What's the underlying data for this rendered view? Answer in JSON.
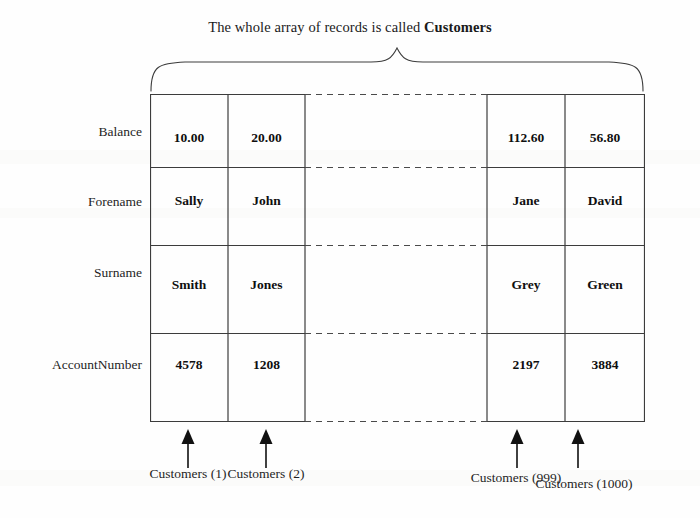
{
  "title": {
    "prefix": "The whole array of records is called ",
    "emphasis": "Customers"
  },
  "field_labels": [
    "Balance",
    "Forename",
    "Surname",
    "AccountNumber"
  ],
  "records": [
    {
      "caption": "Customers (1)",
      "Balance": "10.00",
      "Forename": "Sally",
      "Surname": "Smith",
      "AccountNumber": "4578"
    },
    {
      "caption": "Customers (2)",
      "Balance": "20.00",
      "Forename": "John",
      "Surname": "Jones",
      "AccountNumber": "1208"
    },
    {
      "caption": "Customers (999)",
      "Balance": "112.60",
      "Forename": "Jane",
      "Surname": "Grey",
      "AccountNumber": "2197"
    },
    {
      "caption": "Customers (1000)",
      "Balance": "56.80",
      "Forename": "David",
      "Surname": "Green",
      "AccountNumber": "3884"
    }
  ],
  "ellipsis_gap": {
    "present": true,
    "style": "dashed",
    "meaning": "records 3 through 998 omitted"
  },
  "colors": {
    "background": "#fefefe",
    "line": "#3c3c3c",
    "dashed_line": "#4a4a4a",
    "text": "#1a1a1a",
    "arrow": "#111111"
  }
}
